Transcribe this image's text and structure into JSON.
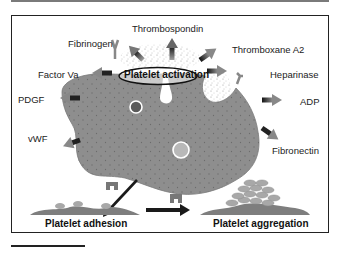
{
  "figure": {
    "title_center": "Platelet activation",
    "secreted_factors": [
      {
        "id": "thrombospondin",
        "label": "Thrombospondin"
      },
      {
        "id": "fibrinogen",
        "label": "Fibrinogen"
      },
      {
        "id": "thromboxane-a2",
        "label": "Thromboxane A2"
      },
      {
        "id": "factor-va",
        "label": "Factor Va"
      },
      {
        "id": "heparinase",
        "label": "Heparinase"
      },
      {
        "id": "pdgf",
        "label": "PDGF"
      },
      {
        "id": "adp",
        "label": "ADP"
      },
      {
        "id": "vwf",
        "label": "vWF"
      },
      {
        "id": "fibronectin",
        "label": "Fibronectin"
      }
    ],
    "stages": {
      "adhesion": "Platelet adhesion",
      "aggregation": "Platelet aggregation"
    },
    "colors": {
      "cell_fill": "#8e8e8e",
      "cell_dots": "#6f6f6f",
      "frame": "#222222",
      "arrow_dark": "#1a1a1a",
      "arrow_light": "#9a9a9a",
      "granule_dark": "#5a5a5a",
      "granule_light": "#b8b8b8"
    }
  }
}
